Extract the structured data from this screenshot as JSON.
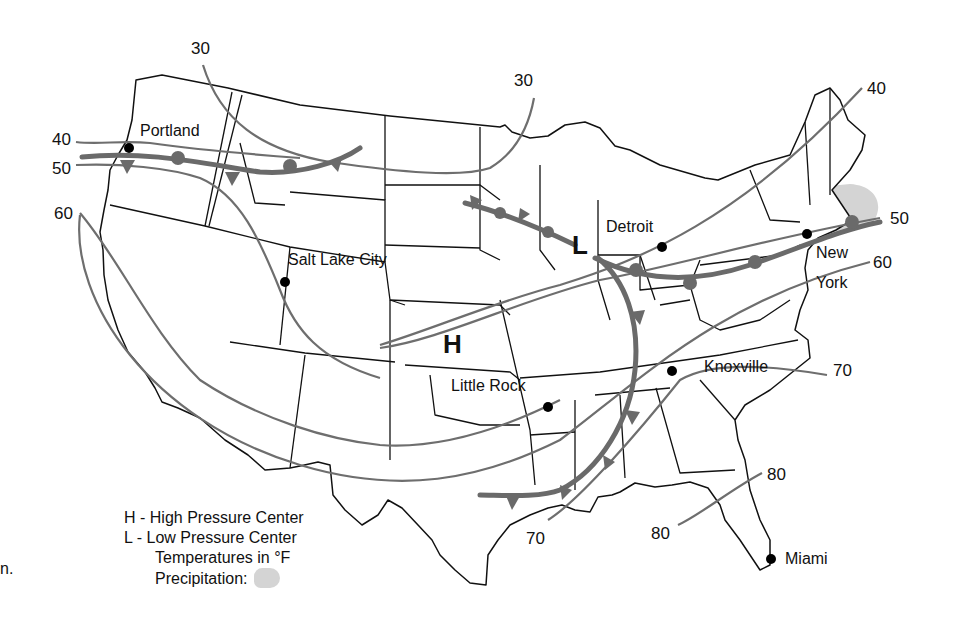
{
  "cities": [
    {
      "name": "Portland",
      "x": 129,
      "y": 148
    },
    {
      "name": "Salt Lake City",
      "x": 285,
      "y": 282
    },
    {
      "name": "Detroit",
      "x": 662,
      "y": 247
    },
    {
      "name": "New York",
      "x": 807,
      "y": 234
    },
    {
      "name": "Little Rock",
      "x": 548,
      "y": 407
    },
    {
      "name": "Knoxville",
      "x": 672,
      "y": 371
    },
    {
      "name": "Miami",
      "x": 771,
      "y": 559
    }
  ],
  "city_labels": {
    "portland": "Portland",
    "salt_lake_city": "Salt Lake City",
    "detroit": "Detroit",
    "new_york_line1": "New",
    "new_york_line2": "York",
    "little_rock": "Little Rock",
    "knoxville": "Knoxville",
    "miami": "Miami"
  },
  "pressure_centers": {
    "high": {
      "symbol": "H",
      "x": 453,
      "y": 343
    },
    "low": {
      "symbol": "L",
      "x": 580,
      "y": 245
    }
  },
  "isotherm_labels": {
    "t30_west": "30",
    "t30_east": "30",
    "t40_west": "40",
    "t40_east": "40",
    "t50_west": "50",
    "t50_east": "50",
    "t60_west": "60",
    "t60_east": "60",
    "t70_east": "70",
    "t70_south": "70",
    "t80_east": "80",
    "t80_south": "80"
  },
  "isotherms_f": [
    30,
    40,
    50,
    60,
    70,
    80
  ],
  "legend": {
    "high": "H - High Pressure Center",
    "low": "L - Low Pressure Center",
    "temps": "Temperatures in °F",
    "precip": "Precipitation:"
  },
  "stray_text": "n.",
  "colors": {
    "precipitation": "#d4d4d4",
    "fronts": "#6a6a6a",
    "isotherms": "#6e6e6e",
    "borders": "#111111"
  }
}
